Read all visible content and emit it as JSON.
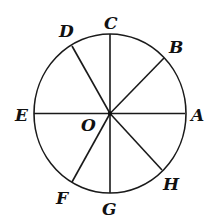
{
  "diagram": {
    "type": "circle-with-radii",
    "center_label": "O",
    "stroke_color": "#1a1a1a",
    "background": "#ffffff",
    "points": [
      {
        "id": "A",
        "label": "A"
      },
      {
        "id": "B",
        "label": "B"
      },
      {
        "id": "C",
        "label": "C"
      },
      {
        "id": "D",
        "label": "D"
      },
      {
        "id": "E",
        "label": "E"
      },
      {
        "id": "F",
        "label": "F"
      },
      {
        "id": "G",
        "label": "G"
      },
      {
        "id": "H",
        "label": "H"
      }
    ],
    "segments": [
      "EA",
      "CG",
      "OB",
      "OD",
      "OF",
      "OH"
    ]
  }
}
